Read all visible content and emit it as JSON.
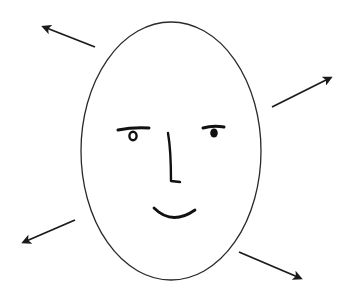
{
  "diagram": {
    "title": "Face with outward arrows",
    "background": "#ffffff",
    "stroke_color": "#1a1a1a",
    "face": {
      "shape": "ellipse",
      "center": [
        171,
        151
      ],
      "rx": 90,
      "ry": 129,
      "features": [
        "left-eye",
        "right-eye",
        "nose",
        "smile"
      ]
    },
    "arrows": [
      {
        "name": "arrow-upper-left",
        "from": [
          95,
          47
        ],
        "to": [
          42,
          26
        ]
      },
      {
        "name": "arrow-upper-right",
        "from": [
          272,
          107
        ],
        "to": [
          332,
          77
        ]
      },
      {
        "name": "arrow-lower-left",
        "from": [
          75,
          220
        ],
        "to": [
          22,
          243
        ]
      },
      {
        "name": "arrow-lower-right",
        "from": [
          239,
          252
        ],
        "to": [
          302,
          279
        ]
      }
    ]
  }
}
